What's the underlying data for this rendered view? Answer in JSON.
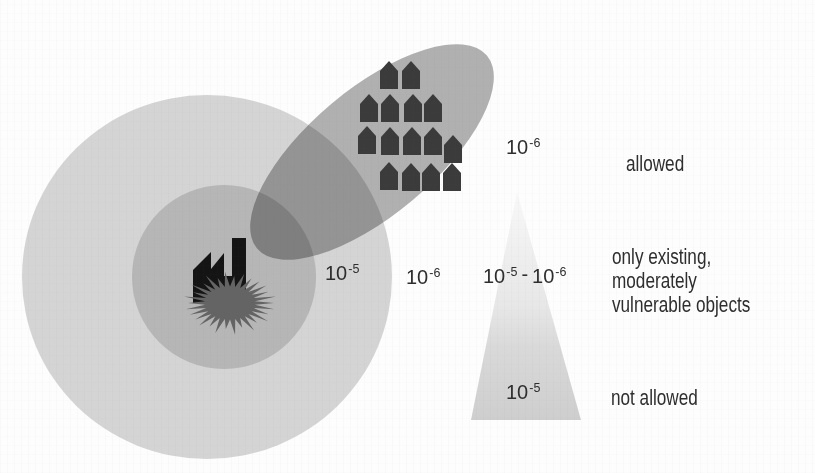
{
  "colors": {
    "background": "#fdfdfd",
    "outer_zone": "#d4d4d4",
    "inner_zone": "#b6b6b6",
    "plume": "#b2b2b2",
    "explosion": "#646464",
    "factory": "#141414",
    "house": "#3b3b3b",
    "wedge_top": "#f8f8f8",
    "wedge_mid1": "#e7e7e7",
    "wedge_mid2": "#d9d9d9",
    "wedge_bottom": "#cecece",
    "text": "#2e2e2e"
  },
  "map": {
    "houses_count": 15,
    "icons": {
      "factory": "factory-icon",
      "explosion": "explosion-icon",
      "house": "house-icon"
    },
    "labels": {
      "contour_1e5": {
        "base": "10",
        "exp": "-5"
      },
      "contour_1e6": {
        "base": "10",
        "exp": "-6"
      }
    }
  },
  "legend": {
    "wedge_top_label": {
      "base": "10",
      "exp": "-6"
    },
    "wedge_range_label": {
      "base_a": "10",
      "exp_a": "-5",
      "separator": "-",
      "base_b": "10",
      "exp_b": "-6"
    },
    "wedge_bottom_label": {
      "base": "10",
      "exp": "-5"
    },
    "rows": [
      {
        "label": "allowed"
      },
      {
        "lines": [
          "only existing,",
          "moderately",
          "vulnerable objects"
        ]
      },
      {
        "label": "not allowed"
      }
    ]
  }
}
